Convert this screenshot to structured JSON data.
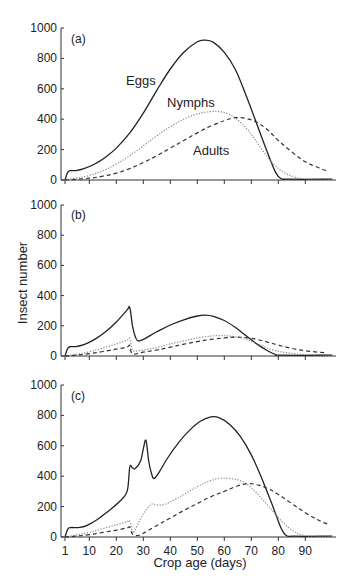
{
  "chart_data": {
    "type": "line",
    "xlabel": "Crop age (days)",
    "ylabel": "Insect number",
    "x_ticks": [
      1,
      10,
      20,
      30,
      40,
      50,
      60,
      70,
      80,
      90
    ],
    "y_ticks": [
      0,
      200,
      400,
      600,
      800,
      1000
    ],
    "xlim": [
      0,
      100
    ],
    "ylim": [
      0,
      1000
    ],
    "grid": false,
    "legend": "none (inline series labels in panel a)",
    "series_styles": {
      "Eggs": {
        "stroke": "#222222",
        "dash": "solid"
      },
      "Nymphs": {
        "stroke": "#888888",
        "dash": "dotted"
      },
      "Adults": {
        "stroke": "#333333",
        "dash": "dashed"
      }
    },
    "panels": [
      {
        "label": "(a)",
        "series_labels": [
          {
            "text": "Eggs",
            "day": 27,
            "value": 640
          },
          {
            "text": "Nymphs",
            "day": 45,
            "value": 470
          },
          {
            "text": "Adults",
            "day": 52,
            "value": 170
          }
        ],
        "series": [
          {
            "name": "Eggs",
            "points": [
              [
                1,
                0
              ],
              [
                2,
                50
              ],
              [
                3,
                62
              ],
              [
                5,
                62
              ],
              [
                8,
                75
              ],
              [
                12,
                105
              ],
              [
                16,
                150
              ],
              [
                20,
                210
              ],
              [
                25,
                310
              ],
              [
                30,
                440
              ],
              [
                35,
                590
              ],
              [
                40,
                730
              ],
              [
                45,
                840
              ],
              [
                50,
                910
              ],
              [
                53,
                920
              ],
              [
                56,
                905
              ],
              [
                60,
                840
              ],
              [
                64,
                730
              ],
              [
                68,
                560
              ],
              [
                72,
                370
              ],
              [
                76,
                180
              ],
              [
                79,
                50
              ],
              [
                81,
                10
              ],
              [
                84,
                5
              ],
              [
                100,
                5
              ]
            ]
          },
          {
            "name": "Nymphs",
            "points": [
              [
                1,
                0
              ],
              [
                5,
                12
              ],
              [
                10,
                30
              ],
              [
                15,
                60
              ],
              [
                20,
                105
              ],
              [
                25,
                160
              ],
              [
                30,
                225
              ],
              [
                35,
                290
              ],
              [
                40,
                350
              ],
              [
                45,
                400
              ],
              [
                50,
                435
              ],
              [
                55,
                450
              ],
              [
                58,
                450
              ],
              [
                62,
                430
              ],
              [
                66,
                380
              ],
              [
                70,
                300
              ],
              [
                74,
                200
              ],
              [
                78,
                110
              ],
              [
                82,
                50
              ],
              [
                86,
                20
              ],
              [
                90,
                8
              ],
              [
                100,
                5
              ]
            ]
          },
          {
            "name": "Adults",
            "points": [
              [
                1,
                0
              ],
              [
                10,
                12
              ],
              [
                15,
                25
              ],
              [
                20,
                45
              ],
              [
                25,
                75
              ],
              [
                30,
                115
              ],
              [
                35,
                160
              ],
              [
                40,
                210
              ],
              [
                45,
                260
              ],
              [
                50,
                310
              ],
              [
                55,
                355
              ],
              [
                60,
                390
              ],
              [
                64,
                410
              ],
              [
                68,
                405
              ],
              [
                72,
                380
              ],
              [
                76,
                330
              ],
              [
                80,
                260
              ],
              [
                85,
                185
              ],
              [
                90,
                120
              ],
              [
                95,
                80
              ],
              [
                98,
                60
              ]
            ]
          }
        ]
      },
      {
        "label": "(b)",
        "series": [
          {
            "name": "Eggs",
            "points": [
              [
                1,
                0
              ],
              [
                2,
                50
              ],
              [
                3,
                62
              ],
              [
                5,
                62
              ],
              [
                8,
                75
              ],
              [
                12,
                110
              ],
              [
                16,
                160
              ],
              [
                20,
                225
              ],
              [
                24,
                305
              ],
              [
                25,
                320
              ],
              [
                26,
                200
              ],
              [
                27,
                130
              ],
              [
                28,
                100
              ],
              [
                30,
                110
              ],
              [
                35,
                160
              ],
              [
                40,
                205
              ],
              [
                45,
                240
              ],
              [
                50,
                265
              ],
              [
                53,
                270
              ],
              [
                56,
                262
              ],
              [
                60,
                235
              ],
              [
                64,
                190
              ],
              [
                68,
                135
              ],
              [
                72,
                80
              ],
              [
                76,
                35
              ],
              [
                79,
                10
              ],
              [
                81,
                5
              ],
              [
                100,
                5
              ]
            ]
          },
          {
            "name": "Nymphs",
            "points": [
              [
                1,
                0
              ],
              [
                5,
                10
              ],
              [
                10,
                28
              ],
              [
                15,
                52
              ],
              [
                20,
                80
              ],
              [
                24,
                105
              ],
              [
                25,
                115
              ],
              [
                26,
                40
              ],
              [
                28,
                35
              ],
              [
                32,
                45
              ],
              [
                36,
                60
              ],
              [
                40,
                80
              ],
              [
                45,
                100
              ],
              [
                50,
                120
              ],
              [
                55,
                132
              ],
              [
                59,
                135
              ],
              [
                63,
                130
              ],
              [
                67,
                115
              ],
              [
                71,
                90
              ],
              [
                75,
                60
              ],
              [
                79,
                35
              ],
              [
                84,
                20
              ],
              [
                90,
                10
              ],
              [
                100,
                5
              ]
            ]
          },
          {
            "name": "Adults",
            "points": [
              [
                1,
                0
              ],
              [
                5,
                5
              ],
              [
                10,
                15
              ],
              [
                15,
                30
              ],
              [
                20,
                45
              ],
              [
                24,
                60
              ],
              [
                25,
                70
              ],
              [
                26,
                15
              ],
              [
                30,
                25
              ],
              [
                35,
                40
              ],
              [
                40,
                58
              ],
              [
                45,
                78
              ],
              [
                50,
                95
              ],
              [
                55,
                110
              ],
              [
                60,
                120
              ],
              [
                64,
                125
              ],
              [
                68,
                122
              ],
              [
                72,
                110
              ],
              [
                76,
                92
              ],
              [
                80,
                72
              ],
              [
                85,
                50
              ],
              [
                90,
                35
              ],
              [
                95,
                25
              ],
              [
                98,
                20
              ]
            ]
          }
        ]
      },
      {
        "label": "(c)",
        "series": [
          {
            "name": "Eggs",
            "points": [
              [
                1,
                0
              ],
              [
                2,
                50
              ],
              [
                3,
                62
              ],
              [
                6,
                62
              ],
              [
                9,
                75
              ],
              [
                13,
                115
              ],
              [
                17,
                170
              ],
              [
                21,
                230
              ],
              [
                24,
                300
              ],
              [
                25,
                460
              ],
              [
                26,
                455
              ],
              [
                27,
                450
              ],
              [
                29,
                500
              ],
              [
                30,
                580
              ],
              [
                31,
                635
              ],
              [
                32,
                500
              ],
              [
                33,
                420
              ],
              [
                34,
                385
              ],
              [
                36,
                430
              ],
              [
                39,
                520
              ],
              [
                43,
                620
              ],
              [
                47,
                700
              ],
              [
                51,
                760
              ],
              [
                55,
                790
              ],
              [
                58,
                785
              ],
              [
                62,
                740
              ],
              [
                66,
                660
              ],
              [
                70,
                540
              ],
              [
                74,
                380
              ],
              [
                78,
                200
              ],
              [
                81,
                60
              ],
              [
                83,
                10
              ],
              [
                86,
                5
              ],
              [
                100,
                5
              ]
            ]
          },
          {
            "name": "Nymphs",
            "points": [
              [
                1,
                0
              ],
              [
                5,
                12
              ],
              [
                10,
                30
              ],
              [
                15,
                55
              ],
              [
                20,
                80
              ],
              [
                24,
                100
              ],
              [
                25,
                105
              ],
              [
                26,
                30
              ],
              [
                27,
                50
              ],
              [
                30,
                150
              ],
              [
                33,
                215
              ],
              [
                35,
                210
              ],
              [
                38,
                215
              ],
              [
                42,
                250
              ],
              [
                46,
                290
              ],
              [
                50,
                330
              ],
              [
                54,
                365
              ],
              [
                58,
                385
              ],
              [
                62,
                385
              ],
              [
                66,
                370
              ],
              [
                70,
                325
              ],
              [
                74,
                250
              ],
              [
                78,
                170
              ],
              [
                82,
                90
              ],
              [
                86,
                35
              ],
              [
                90,
                10
              ],
              [
                100,
                5
              ]
            ]
          },
          {
            "name": "Adults",
            "points": [
              [
                1,
                0
              ],
              [
                5,
                5
              ],
              [
                10,
                15
              ],
              [
                15,
                30
              ],
              [
                20,
                45
              ],
              [
                24,
                60
              ],
              [
                25,
                65
              ],
              [
                26,
                20
              ],
              [
                28,
                10
              ],
              [
                30,
                25
              ],
              [
                35,
                75
              ],
              [
                40,
                125
              ],
              [
                45,
                175
              ],
              [
                50,
                220
              ],
              [
                55,
                265
              ],
              [
                60,
                300
              ],
              [
                64,
                330
              ],
              [
                68,
                350
              ],
              [
                72,
                345
              ],
              [
                76,
                320
              ],
              [
                80,
                280
              ],
              [
                85,
                220
              ],
              [
                90,
                160
              ],
              [
                95,
                110
              ],
              [
                99,
                80
              ]
            ]
          }
        ]
      }
    ]
  },
  "figure": {
    "ylabel": "Insect number",
    "xlabel": "Crop age (days)",
    "panels": [
      {
        "label": "(a)",
        "eggs_label": "Eggs",
        "nymphs_label": "Nymphs",
        "adults_label": "Adults"
      },
      {
        "label": "(b)"
      },
      {
        "label": "(c)"
      }
    ]
  }
}
